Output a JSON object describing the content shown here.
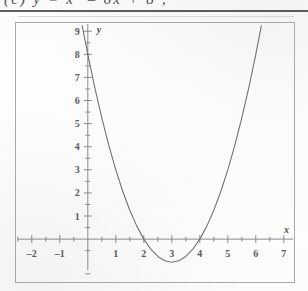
{
  "header": {
    "cut_off_text": "(c) y = x² – 6x + 8 ;",
    "rule_note": ""
  },
  "chart_data": {
    "type": "line",
    "title": "",
    "subtitle": "",
    "xlabel": "x",
    "ylabel": "y",
    "xlim": [
      -2.6,
      7.4
    ],
    "ylim": [
      -1.9,
      9.4
    ],
    "grid": false,
    "legend": false,
    "legend_position": "none",
    "x_ticks": [
      -2,
      -1,
      1,
      2,
      3,
      4,
      5,
      6,
      7
    ],
    "x_tick_labels": [
      "–2",
      "–1",
      "1",
      "2",
      "3",
      "4",
      "5",
      "6",
      "7"
    ],
    "x_minor_tick_step": 0.5,
    "y_ticks": [
      1,
      2,
      3,
      4,
      5,
      6,
      7,
      8,
      9
    ],
    "y_tick_labels": [
      "1",
      "2",
      "3",
      "4",
      "5",
      "6",
      "7",
      "8",
      "9"
    ],
    "y_minor_tick_step": 0.5,
    "curve_color": "#6b6b6b",
    "axis_color": "#8a8a8a",
    "series": [
      {
        "name": "y = x² – 6x + 8",
        "equation": "y = x^2 - 6x + 8",
        "vertex": [
          3,
          -1
        ],
        "roots": [
          2,
          4
        ],
        "y_intercept": 8,
        "x": [
          -0.2,
          0,
          0.25,
          0.5,
          0.75,
          1,
          1.25,
          1.5,
          1.75,
          2,
          2.25,
          2.5,
          2.75,
          3,
          3.25,
          3.5,
          3.75,
          4,
          4.25,
          4.5,
          4.75,
          5,
          5.25,
          5.5,
          5.75,
          6,
          6.2
        ],
        "values": [
          9.24,
          8,
          6.5625,
          5.25,
          4.0625,
          3,
          2.0625,
          1.25,
          0.5625,
          0,
          -0.4375,
          -0.75,
          -0.9375,
          -1,
          -0.9375,
          -0.75,
          -0.4375,
          0,
          0.5625,
          1.25,
          2.0625,
          3,
          4.0625,
          5.25,
          6.5625,
          8,
          9.24
        ]
      }
    ],
    "annotations": []
  },
  "axis_labels": {
    "x_axis_name": "x",
    "y_axis_name": "y"
  }
}
